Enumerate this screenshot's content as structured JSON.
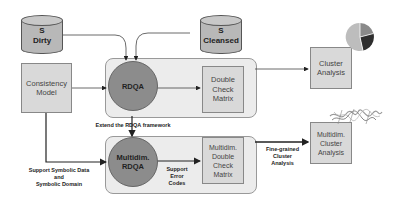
{
  "diagram": {
    "sources": {
      "dirty": {
        "line1": "S",
        "line2": "Dirty"
      },
      "cleansed": {
        "line1": "S",
        "line2": "Cleansed"
      }
    },
    "consistency_model": {
      "line1": "Consistency",
      "line2": "Model"
    },
    "rdqa": {
      "label": "RDQA"
    },
    "double_check_matrix": {
      "line1": "Double",
      "line2": "Check",
      "line3": "Matrix"
    },
    "cluster_analysis": {
      "line1": "Cluster",
      "line2": "Analysis"
    },
    "multidim_rdqa": {
      "line1": "Multidim.",
      "line2": "RDQA"
    },
    "multidim_double_check_matrix": {
      "line1": "Multidim.",
      "line2": "Double",
      "line3": "Check",
      "line4": "Matrix"
    },
    "multidim_cluster_analysis": {
      "line1": "Multidim.",
      "line2": "Cluster",
      "line3": "Analysis"
    },
    "edge_labels": {
      "extend": "Extend the RDQA framework",
      "symbolic_line1": "Support Symbolic Data",
      "symbolic_line2": "and",
      "symbolic_line3": "Symbolic Domain",
      "error_line1": "Support",
      "error_line2": "Error",
      "error_line3": "Codes",
      "fine_line1": "Fine-grained",
      "fine_line2": "Cluster",
      "fine_line3": "Analysis"
    },
    "icons": {
      "pie_chart": "pie-chart-icon",
      "scatter_cluster": "scatter-cluster-icon"
    },
    "colors": {
      "circle_fill": "#8c8c8c",
      "box_fill": "#d9d9d9",
      "panel_fill": "#ececec",
      "cylinder_fill": "#b8b8b8"
    }
  }
}
